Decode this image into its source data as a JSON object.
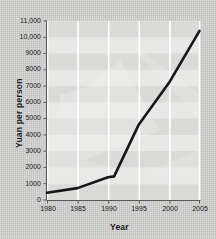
{
  "chart_data": {
    "type": "line",
    "title": "",
    "xlabel": "Year",
    "ylabel": "Yuan per person",
    "xlim": [
      1980,
      2005
    ],
    "ylim": [
      0,
      11000
    ],
    "grid": true,
    "legend": "none",
    "x_ticks": [
      "1980",
      "1985",
      "1990",
      "1995",
      "2000",
      "2005"
    ],
    "y_ticks": [
      "0",
      "1000",
      "2000",
      "3000",
      "4000",
      "5000",
      "6000",
      "7000",
      "8000",
      "9000",
      "10,000",
      "11,000"
    ],
    "x": [
      1980,
      1985,
      1990,
      1991,
      1995,
      2000,
      2005
    ],
    "values": [
      440,
      730,
      1400,
      1450,
      4600,
      7200,
      10400
    ],
    "series": [
      {
        "name": "Yuan per person",
        "color": "#171717",
        "x": [
          1980,
          1985,
          1990,
          1991,
          1995,
          2000,
          2005
        ],
        "values": [
          440,
          730,
          1400,
          1450,
          4600,
          7200,
          10400
        ]
      }
    ],
    "colors": {
      "line": "#171717",
      "plot_background": "#e6e6e4",
      "band": "#d8d8d6",
      "gridline": "#ffffff",
      "axis": "#555555",
      "page_background": "#c9c9c7"
    }
  }
}
